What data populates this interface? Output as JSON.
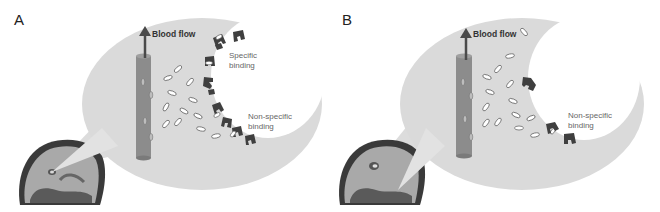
{
  "figure": {
    "panels": [
      {
        "id": "A",
        "label": "A",
        "blood_flow_label": "Blood flow",
        "annotations": [
          "Specific binding",
          "Non-specific binding"
        ],
        "specific_line1": "Specific",
        "specific_line2": "binding",
        "nonspecific_line1": "Non-specific",
        "nonspecific_line2": "binding",
        "receptor_count": 10,
        "free_tracer_count": 12
      },
      {
        "id": "B",
        "label": "B",
        "blood_flow_label": "Blood flow",
        "annotations": [
          "Non-specific binding"
        ],
        "nonspecific_line1": "Non-specific",
        "nonspecific_line2": "binding",
        "receptor_count": 3,
        "free_tracer_count": 15
      }
    ],
    "colors": {
      "bubble": "#d9d9d9",
      "vessel": "#8a8a8a",
      "receptor": "#3f3f3f",
      "text": "#555555",
      "arrow": "#4a4a4a"
    }
  }
}
